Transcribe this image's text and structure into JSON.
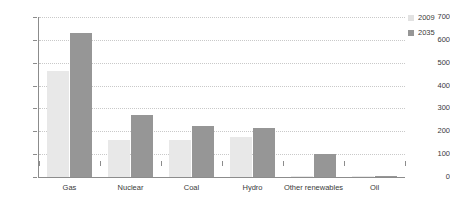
{
  "chart_data": {
    "type": "bar",
    "title": "",
    "subtitle": "",
    "xlabel": "",
    "ylabel": "TWh",
    "ylim": [
      0,
      700
    ],
    "yticks": [
      0,
      100,
      200,
      300,
      400,
      500,
      600,
      700
    ],
    "grid": true,
    "legend_position": "right",
    "categories": [
      "Gas",
      "Nuclear",
      "Coal",
      "Hydro",
      "Other renewables",
      "Oil"
    ],
    "series": [
      {
        "name": "2009",
        "color": "#e8e8e8",
        "values": [
          465,
          160,
          160,
          175,
          3,
          5
        ]
      },
      {
        "name": "2035",
        "color": "#969696",
        "values": [
          630,
          270,
          225,
          215,
          100,
          5
        ]
      }
    ]
  },
  "legend": {
    "entries": [
      {
        "label": "2009",
        "swatch": "legend-swatch-2009"
      },
      {
        "label": "2035",
        "swatch": "legend-swatch-2035"
      }
    ]
  },
  "colors": {
    "series_2009": "#e8e8e8",
    "series_2035": "#969696",
    "axis": "#8c8c8c",
    "gridline": "#c9c9c9",
    "text": "#3a3a3a",
    "background": "#ffffff"
  }
}
